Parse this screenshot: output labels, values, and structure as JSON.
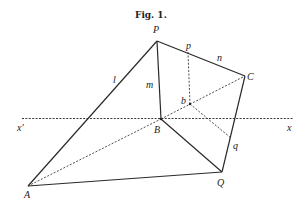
{
  "figure": {
    "title": "Fig. 1.",
    "labels": {
      "P": "P",
      "p": "p",
      "n": "n",
      "C": "C",
      "l": "l",
      "m": "m",
      "b": "b",
      "B": "B",
      "x_prime": "x'",
      "x": "x",
      "q": "q",
      "A": "A",
      "Q": "Q"
    }
  }
}
